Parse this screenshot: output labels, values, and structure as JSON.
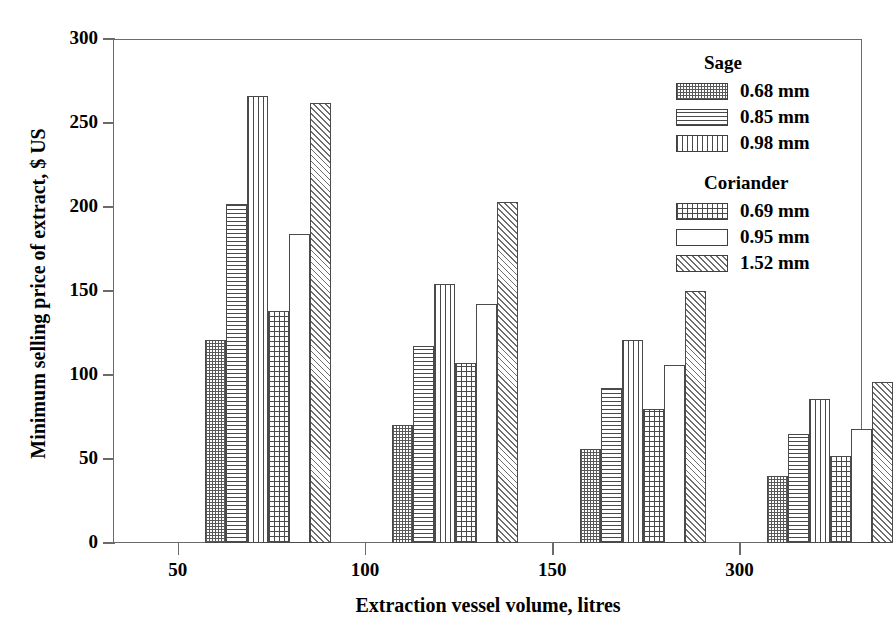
{
  "chart_data": {
    "type": "bar",
    "title": "",
    "xlabel": "Extraction vessel volume, litres",
    "ylabel": "Minimum selling price of extract, $ US",
    "categories": [
      "50",
      "100",
      "150",
      "300"
    ],
    "xtick_labels": [
      "50",
      "100",
      "150",
      "300"
    ],
    "ytick_labels": [
      "0",
      "50",
      "100",
      "150",
      "200",
      "250",
      "300"
    ],
    "ylim": [
      0,
      300
    ],
    "ytick_step": 50,
    "grid": false,
    "legend_position": "top-right",
    "series": [
      {
        "name": "0.68 mm",
        "group": "Sage",
        "pattern": "checkerboard",
        "values": [
          121,
          70,
          56,
          40
        ]
      },
      {
        "name": "0.85 mm",
        "group": "Sage",
        "pattern": "horizontal-lines",
        "values": [
          202,
          117,
          92,
          65
        ]
      },
      {
        "name": "0.98 mm",
        "group": "Sage",
        "pattern": "vertical-lines",
        "values": [
          266,
          154,
          121,
          86
        ]
      },
      {
        "name": "0.69 mm",
        "group": "Coriander",
        "pattern": "grid",
        "values": [
          138,
          107,
          80,
          52
        ]
      },
      {
        "name": "0.95 mm",
        "group": "Coriander",
        "pattern": "blank",
        "values": [
          184,
          142,
          106,
          68
        ]
      },
      {
        "name": "1.52 mm",
        "group": "Coriander",
        "pattern": "diagonal-hatch",
        "values": [
          262,
          203,
          150,
          96
        ]
      }
    ]
  },
  "legend": {
    "groups": [
      {
        "title": "Sage",
        "entries": [
          {
            "label": "0.68 mm",
            "pattern": "p-checker"
          },
          {
            "label": "0.85 mm",
            "pattern": "p-hlines"
          },
          {
            "label": "0.98 mm",
            "pattern": "p-vlines"
          }
        ]
      },
      {
        "title": "Coriander",
        "entries": [
          {
            "label": "0.69 mm",
            "pattern": "p-grid"
          },
          {
            "label": "0.95 mm",
            "pattern": "p-blank"
          },
          {
            "label": "1.52 mm",
            "pattern": "p-diag"
          }
        ]
      }
    ]
  },
  "colors": {
    "axis": "#6b6b6b",
    "bar_outline": "#4a4a4a",
    "background": "#ffffff",
    "text": "#000000"
  }
}
